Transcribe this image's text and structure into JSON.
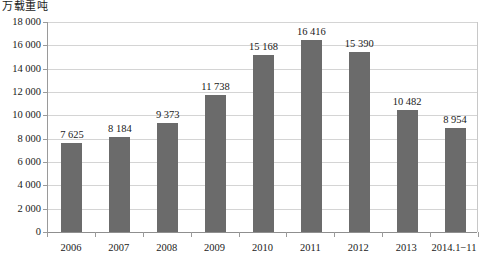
{
  "chart_data": {
    "type": "bar",
    "title": "",
    "subtitle": "",
    "xlabel": "",
    "ylabel": "万载重吨",
    "ylim": [
      0,
      18000
    ],
    "ytick_labels": [
      "18 000",
      "16 000",
      "14 000",
      "12 000",
      "10 000",
      "8 000",
      "6 000",
      "4 000",
      "2 000",
      "0"
    ],
    "ytick_values": [
      18000,
      16000,
      14000,
      12000,
      10000,
      8000,
      6000,
      4000,
      2000,
      0
    ],
    "grid": true,
    "legend": null,
    "legend_position": "none",
    "categories": [
      "2006",
      "2007",
      "2008",
      "2009",
      "2010",
      "2011",
      "2012",
      "2013",
      "2014.1−11"
    ],
    "values": [
      7625,
      8184,
      9373,
      11738,
      15168,
      16416,
      15390,
      10482,
      8954
    ],
    "value_labels": [
      "7 625",
      "8 184",
      "9 373",
      "11 738",
      "15 168",
      "16 416",
      "15 390",
      "10 482",
      "8 954"
    ],
    "series": [
      {
        "name": "",
        "values": [
          7625,
          8184,
          9373,
          11738,
          15168,
          16416,
          15390,
          10482,
          8954
        ]
      }
    ],
    "colors": {
      "bar": "#6b6b6b",
      "gridline": "#d4d4d4",
      "axis": "#8f8f8f",
      "text": "#1a1a1a",
      "background": "#ffffff"
    }
  }
}
